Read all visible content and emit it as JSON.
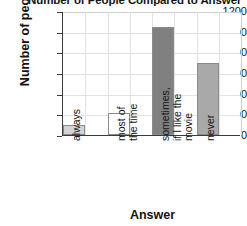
{
  "chart_data": {
    "type": "bar",
    "title": "Number of People Compared to Answer",
    "xlabel": "Answer",
    "ylabel": "Number of people",
    "categories": [
      "always",
      "most of\nthe time",
      "sometimes,\nif I like the\nmovie",
      "never"
    ],
    "values": [
      100,
      210,
      1050,
      700
    ],
    "ylim": [
      0,
      1200
    ],
    "yticks": [
      0,
      200,
      400,
      600,
      800,
      1000,
      1200
    ],
    "ytick_labels": [
      "0",
      "200",
      "400",
      "600",
      "800",
      "1000",
      "1200"
    ],
    "grid": true,
    "legend": "none",
    "bar_colors": [
      "#d4d4d4",
      "#ffffff",
      "#808080",
      "#a9a9a9"
    ],
    "bar_edge_color": "#8a8a8a",
    "axis_color": "#3b3b3b",
    "grid_color": "#e2e2e2",
    "background": "#ffffff"
  }
}
